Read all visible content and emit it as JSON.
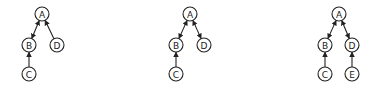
{
  "diagrams": [
    {
      "id": "panel-1",
      "nodes": [
        {
          "label": "A",
          "x": 42,
          "y": 14
        },
        {
          "label": "B",
          "x": 29,
          "y": 45
        },
        {
          "label": "D",
          "x": 57,
          "y": 45
        },
        {
          "label": "C",
          "x": 29,
          "y": 74
        }
      ],
      "edges": [
        {
          "from": "A",
          "to": "B",
          "arrow_start": true,
          "arrow_end": true
        },
        {
          "from": "D",
          "to": "A",
          "arrow_start": false,
          "arrow_end": true
        },
        {
          "from": "C",
          "to": "B",
          "arrow_start": false,
          "arrow_end": true
        }
      ]
    },
    {
      "id": "panel-2",
      "nodes": [
        {
          "label": "A",
          "x": 190,
          "y": 14
        },
        {
          "label": "B",
          "x": 176,
          "y": 45
        },
        {
          "label": "D",
          "x": 204,
          "y": 45
        },
        {
          "label": "C",
          "x": 176,
          "y": 74
        }
      ],
      "edges": [
        {
          "from": "A",
          "to": "B",
          "arrow_start": true,
          "arrow_end": true
        },
        {
          "from": "A",
          "to": "D",
          "arrow_start": true,
          "arrow_end": true
        },
        {
          "from": "C",
          "to": "B",
          "arrow_start": false,
          "arrow_end": true
        }
      ]
    },
    {
      "id": "panel-3",
      "nodes": [
        {
          "label": "A",
          "x": 339,
          "y": 14
        },
        {
          "label": "B",
          "x": 325,
          "y": 45
        },
        {
          "label": "D",
          "x": 352,
          "y": 45
        },
        {
          "label": "C",
          "x": 325,
          "y": 74
        },
        {
          "label": "E",
          "x": 352,
          "y": 74
        }
      ],
      "edges": [
        {
          "from": "A",
          "to": "B",
          "arrow_start": true,
          "arrow_end": true
        },
        {
          "from": "A",
          "to": "D",
          "arrow_start": true,
          "arrow_end": true
        },
        {
          "from": "C",
          "to": "B",
          "arrow_start": false,
          "arrow_end": true
        },
        {
          "from": "E",
          "to": "D",
          "arrow_start": false,
          "arrow_end": true
        }
      ]
    }
  ],
  "style": {
    "stroke": "#222222",
    "fill": "#ffffff",
    "node_radius": 7
  }
}
